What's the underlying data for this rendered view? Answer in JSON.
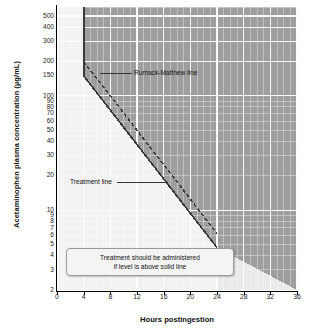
{
  "chart_data": {
    "type": "line",
    "title": "",
    "xlabel": "Hours postingestion",
    "ylabel": "Acetaminophen plasma concentration (µg/mL)",
    "xlim": [
      0,
      36
    ],
    "ylim": [
      2,
      600
    ],
    "yscale": "log",
    "xscale": "linear",
    "grid": true,
    "legend": "none",
    "xticks": [
      0,
      4,
      8,
      12,
      16,
      20,
      24,
      28,
      32,
      36
    ],
    "yticks": [
      2,
      3,
      4,
      5,
      6,
      7,
      8,
      9,
      10,
      20,
      30,
      40,
      50,
      60,
      70,
      80,
      90,
      100,
      150,
      200,
      300,
      400,
      500
    ],
    "ytick_labels": [
      "2",
      "3",
      "4",
      "5",
      "6",
      "7",
      "8",
      "9",
      "10",
      "20",
      "30",
      "40",
      "50",
      "60",
      "70",
      "80",
      "90",
      "100",
      "150",
      "200",
      "300",
      "400",
      "500"
    ],
    "xtick_labels": [
      "0",
      "4",
      "8",
      "12",
      "16",
      "20",
      "24",
      "28",
      "32",
      "36"
    ],
    "series": [
      {
        "name": "Rumack-Matthew line",
        "style": "dashed",
        "color": "#333333",
        "x": [
          4,
          24
        ],
        "y": [
          200,
          6.25
        ]
      },
      {
        "name": "Treatment line",
        "style": "solid",
        "color": "#333333",
        "x": [
          4,
          24
        ],
        "y": [
          150,
          4.7
        ]
      },
      {
        "name": "Treatment line vertical segment",
        "style": "solid",
        "color": "#333333",
        "x": [
          4,
          4
        ],
        "y": [
          150,
          600
        ]
      }
    ],
    "regions": [
      {
        "name": "treatment-indicated-shaded-region",
        "fill": "#9f9f9f",
        "description": "above solid line"
      },
      {
        "name": "no-treatment-region",
        "fill": "#f2f2f2",
        "description": "below solid line"
      }
    ],
    "annotations": [
      {
        "name": "rumack-matthew-line-label",
        "text": "Rumack-Matthew line",
        "x": 12.6,
        "y": 115
      },
      {
        "name": "treatment-line-label",
        "text": "Treatment line",
        "x": 5.5,
        "y": 13.5
      },
      {
        "name": "note-box-line-1",
        "text": "Treatment should be administered",
        "x": 9,
        "y": 5.0
      },
      {
        "name": "note-box-line-2",
        "text": "if level is above solid line",
        "x": 9,
        "y": 4.2
      }
    ]
  },
  "axes": {
    "y_title": "Acetaminophen plasma concentration (µg/mL)",
    "x_title": "Hours postingestion"
  },
  "labels": {
    "rumack": "Rumack-Matthew line",
    "treatment": "Treatment line"
  },
  "note": {
    "line1": "Treatment should be administered",
    "line2": "if level is above solid line"
  },
  "colors": {
    "shaded_region": "#9f9f9f",
    "plot_background": "#f2f2f2",
    "gridline_light": "#ffffff",
    "line_color": "#333333",
    "axis_color": "#000000"
  }
}
